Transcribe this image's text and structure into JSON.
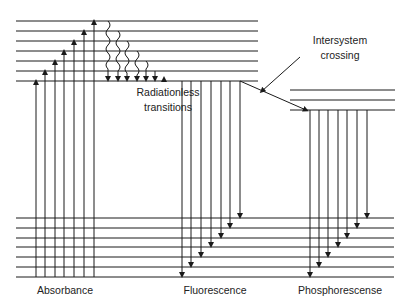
{
  "labels": {
    "absorbance": "Absorbance",
    "fluorescence": "Fluorescence",
    "phosphorescence": "Phosphorescense",
    "radiationless_1": "Radiationless",
    "radiationless_2": "transitions",
    "isc_1": "Intersystem",
    "isc_2": "crossing"
  },
  "levels": {
    "singlet_excited_y": [
      21,
      31,
      41,
      51,
      61,
      71,
      81
    ],
    "triplet_y": [
      90,
      100,
      110
    ],
    "ground_y": [
      218,
      228,
      238,
      247,
      257,
      267,
      277
    ]
  },
  "arrows": {
    "absorbance_x": [
      36,
      45,
      55,
      64,
      74,
      84,
      94
    ],
    "radiationless_x": [
      108,
      118,
      127,
      137,
      146,
      155,
      164
    ],
    "fluorescence_x": [
      182,
      191,
      201,
      211,
      221,
      230,
      240
    ],
    "phosphorescence_x": [
      310,
      319,
      328,
      338,
      347,
      357,
      367
    ]
  },
  "colors": {
    "line": "#1a1a1a"
  }
}
